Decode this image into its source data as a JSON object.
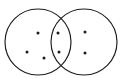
{
  "figure": {
    "background_color": "#ffffff",
    "stroke_color": "#1c1c1c",
    "dot_color": "#1c1c1c",
    "width": 122,
    "height": 82
  },
  "chart_data": {
    "type": "diagram",
    "subtype": "venn",
    "title": "",
    "grid": false,
    "legend": null,
    "sets": [
      {
        "name": "Left circle",
        "cx": 38,
        "cy": 42,
        "r": 33,
        "exclusive_count": 3
      },
      {
        "name": "Right circle",
        "cx": 84,
        "cy": 42,
        "r": 33,
        "exclusive_count": 2
      }
    ],
    "regions": [
      {
        "name": "left-only",
        "count": 3
      },
      {
        "name": "intersection",
        "count": 2
      },
      {
        "name": "right-only",
        "count": 2
      }
    ],
    "total_dots": 7,
    "dots": [
      {
        "region": "left-only",
        "cx": 38,
        "cy": 33,
        "r": 1.5
      },
      {
        "region": "left-only",
        "cx": 27,
        "cy": 52,
        "r": 1.5
      },
      {
        "region": "left-only",
        "cx": 44,
        "cy": 58,
        "r": 1.5
      },
      {
        "region": "intersection",
        "cx": 58,
        "cy": 33,
        "r": 1.5
      },
      {
        "region": "intersection",
        "cx": 59,
        "cy": 52,
        "r": 1.5
      },
      {
        "region": "right-only",
        "cx": 85,
        "cy": 32,
        "r": 1.5
      },
      {
        "region": "right-only",
        "cx": 85,
        "cy": 53,
        "r": 1.5
      }
    ],
    "intersection_points": [
      {
        "x": 61,
        "y": 14
      },
      {
        "x": 61,
        "y": 70
      }
    ]
  }
}
